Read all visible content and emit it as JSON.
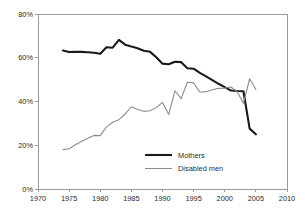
{
  "chart_data": {
    "type": "line",
    "title": "",
    "subtitle": "",
    "xlabel": "",
    "ylabel": "",
    "xlim": [
      1970,
      2010
    ],
    "ylim": [
      0,
      80
    ],
    "grid": false,
    "legend_position": "inside-bottom-center",
    "x_ticks": [
      "1970",
      "1975",
      "1980",
      "1985",
      "1990",
      "1995",
      "2000",
      "2005",
      "2010"
    ],
    "x_tick_values": [
      1970,
      1975,
      1980,
      1985,
      1990,
      1995,
      2000,
      2005,
      2010
    ],
    "y_ticks": [
      "0%",
      "20%",
      "40%",
      "60%",
      "80%"
    ],
    "y_tick_values": [
      0,
      20,
      40,
      60,
      80
    ],
    "series": [
      {
        "name": "Mothers",
        "color": "#1a1a1a",
        "width": 2.1,
        "x": [
          1974,
          1975,
          1976,
          1977,
          1978,
          1979,
          1980,
          1981,
          1982,
          1983,
          1984,
          1985,
          1986,
          1987,
          1988,
          1989,
          1990,
          1991,
          1992,
          1993,
          1994,
          1995,
          1996,
          1997,
          1998,
          1999,
          2000,
          2001,
          2002,
          2003,
          2004,
          2005
        ],
        "values": [
          63.3,
          62.6,
          62.7,
          62.7,
          62.5,
          62.3,
          61.8,
          64.8,
          64.6,
          68.2,
          66.0,
          65.1,
          64.3,
          63.2,
          62.7,
          60.2,
          57.3,
          57.0,
          58.2,
          58.0,
          55.2,
          55.0,
          53.1,
          51.5,
          49.8,
          48.1,
          46.6,
          45.0,
          44.8,
          44.7,
          27.6,
          25.0
        ]
      },
      {
        "name": "Disabled men",
        "color": "#8c8c8c",
        "width": 1.1,
        "x": [
          1974,
          1975,
          1976,
          1977,
          1978,
          1979,
          1980,
          1981,
          1982,
          1983,
          1984,
          1985,
          1986,
          1987,
          1988,
          1989,
          1990,
          1991,
          1992,
          1993,
          1994,
          1995,
          1996,
          1997,
          1998,
          1999,
          2000,
          2001,
          2002,
          2003,
          2004,
          2005
        ],
        "values": [
          18.0,
          18.4,
          20.2,
          21.7,
          23.2,
          24.5,
          24.4,
          28.4,
          30.5,
          31.7,
          34.3,
          37.6,
          36.3,
          35.5,
          35.8,
          37.2,
          39.6,
          34.1,
          44.9,
          41.3,
          48.8,
          48.5,
          44.2,
          44.5,
          45.4,
          46.0,
          46.1,
          46.6,
          44.5,
          39.2,
          50.4,
          45.5
        ]
      }
    ],
    "legend": [
      {
        "label": "Mothers",
        "color": "#1a1a1a",
        "width": 2.1
      },
      {
        "label": "Disabled men",
        "color": "#8c8c8c",
        "width": 1.1
      }
    ],
    "axis_color": "#9a9a9a",
    "text_color": "#2b2b2b"
  }
}
